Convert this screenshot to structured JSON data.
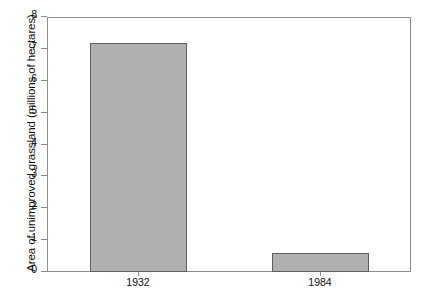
{
  "chart_data": {
    "type": "bar",
    "title": "",
    "xlabel": "",
    "ylabel": "Area of unimproved grassland (millions of hectares)",
    "categories": [
      "1932",
      "1984"
    ],
    "values": [
      7.2,
      0.6
    ],
    "ylim": [
      0,
      8
    ],
    "yticks": [
      "0",
      "1",
      "2",
      "3",
      "4",
      "5",
      "6",
      "7",
      "8"
    ],
    "ytick_values": [
      0,
      1,
      2,
      3,
      4,
      5,
      6,
      7,
      8
    ],
    "grid": false,
    "legend": "none",
    "series": [
      {
        "name": "Area of unimproved grassland",
        "values": [
          7.2,
          0.6
        ]
      }
    ],
    "colors": {
      "bar_fill": "#b0b0b0",
      "bar_border": "#5f5f5f",
      "axis": "#8d8d8d",
      "text": "#111111",
      "background": "#ffffff"
    }
  }
}
